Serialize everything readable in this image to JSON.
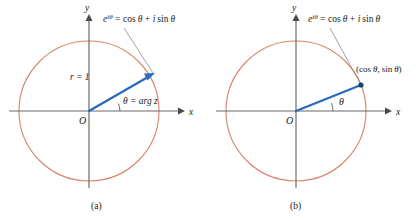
{
  "figure": {
    "type": "diagram",
    "background_color": "#ffffff",
    "colors": {
      "circle": "#d9836c",
      "vector": "#2b6cb8",
      "axis": "#6b6b6b",
      "text": "#1a1a1a",
      "leader": "#8a8a8a"
    },
    "panels": [
      {
        "id": "panel-a",
        "caption": "(a)",
        "center": {
          "x": 89,
          "y": 111
        },
        "radius": 70,
        "axes": {
          "x_label": "x",
          "y_label": "y",
          "origin_label": "O"
        },
        "vector": {
          "angle_degrees": 32,
          "magnitude_label": "r = 1",
          "tip": {
            "x": 152,
            "y": 74
          },
          "arrow": true
        },
        "angle_label": "θ = arg z",
        "formula": "e^{iθ} = cos θ + i sin θ",
        "formula_parts": {
          "base": "e",
          "exponent": "iθ",
          "equals": "=",
          "cos": "cos",
          "theta1": "θ",
          "plus": "+",
          "i": "i",
          "sin": "sin",
          "theta2": "θ"
        },
        "has_leader_line": true
      },
      {
        "id": "panel-b",
        "caption": "(b)",
        "center": {
          "x": 296,
          "y": 111
        },
        "radius": 70,
        "axes": {
          "x_label": "x",
          "y_label": "y",
          "origin_label": "O"
        },
        "vector": {
          "angle_degrees": 22,
          "tip": {
            "x": 361,
            "y": 85
          },
          "arrow": false,
          "endpoint_dot": true
        },
        "point_label": "(cos θ, sin θ)",
        "point_label_parts": {
          "open": "(",
          "cos": "cos",
          "theta1": "θ",
          "comma": ",",
          "sin": "sin",
          "theta2": "θ",
          "close": ")"
        },
        "angle_label": "θ",
        "formula": "e^{iθ} = cos θ + i sin θ",
        "formula_parts": {
          "base": "e",
          "exponent": "iθ",
          "equals": "=",
          "cos": "cos",
          "theta1": "θ",
          "plus": "+",
          "i": "i",
          "sin": "sin",
          "theta2": "θ"
        },
        "has_leader_line": true
      }
    ]
  }
}
